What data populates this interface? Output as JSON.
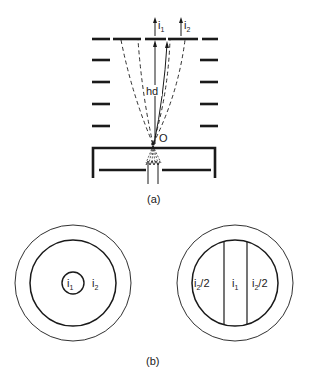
{
  "figure_a": {
    "caption": "(a)",
    "labels": {
      "current_1": "i",
      "current_1_sub": "1",
      "current_2": "i",
      "current_2_sub": "2",
      "height": "hd",
      "origin": "O"
    }
  },
  "figure_b": {
    "caption": "(b)",
    "left_target": {
      "inner_label": "i",
      "inner_label_sub": "1",
      "outer_label": "i",
      "outer_label_sub": "2"
    },
    "right_target": {
      "left_label": "i",
      "left_label_sub": "2",
      "left_label_suffix": "/2",
      "center_label": "i",
      "center_label_sub": "1",
      "right_label": "i",
      "right_label_sub": "2",
      "right_label_suffix": "/2"
    }
  },
  "colors": {
    "ink": "#1a1a1a",
    "background": "#ffffff"
  }
}
